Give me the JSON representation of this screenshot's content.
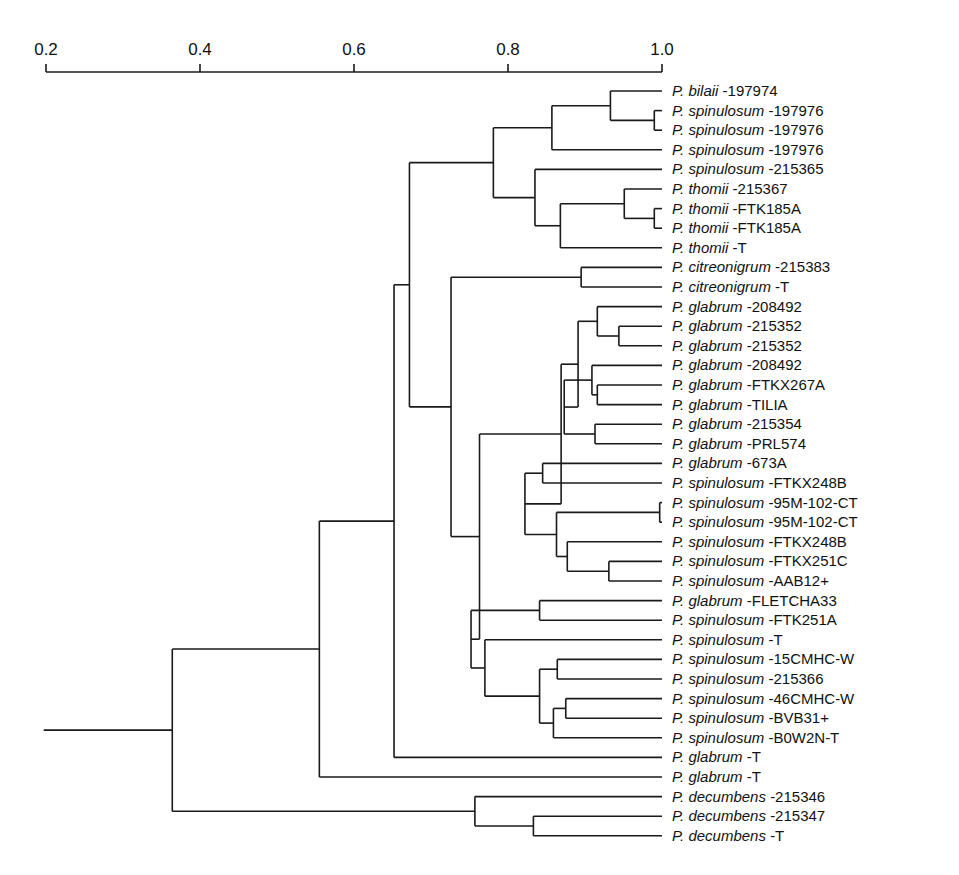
{
  "chart_data": {
    "type": "dendrogram",
    "title": "",
    "xlabel": "",
    "axis": {
      "position": "top",
      "min": 0.2,
      "max": 1.0,
      "ticks": [
        0.2,
        0.4,
        0.6,
        0.8,
        1.0
      ],
      "tick_labels": [
        "0.2",
        "0.4",
        "0.6",
        "0.8",
        "1.0"
      ]
    },
    "leaves": [
      {
        "genus": "P.",
        "species": "bilaii",
        "strain": "-197974"
      },
      {
        "genus": "P.",
        "species": "spinulosum",
        "strain": "-197976"
      },
      {
        "genus": "P.",
        "species": "spinulosum",
        "strain": "-197976"
      },
      {
        "genus": "P.",
        "species": "spinulosum",
        "strain": "-197976"
      },
      {
        "genus": "P.",
        "species": "spinulosum",
        "strain": "-215365"
      },
      {
        "genus": "P.",
        "species": "thomii",
        "strain": "-215367"
      },
      {
        "genus": "P.",
        "species": "thomii",
        "strain": "-FTK185A"
      },
      {
        "genus": "P.",
        "species": "thomii",
        "strain": "-FTK185A"
      },
      {
        "genus": "P.",
        "species": "thomii",
        "strain": "-T"
      },
      {
        "genus": "P.",
        "species": "citreonigrum",
        "strain": "-215383"
      },
      {
        "genus": "P.",
        "species": "citreonigrum",
        "strain": "-T"
      },
      {
        "genus": "P.",
        "species": "glabrum",
        "strain": "-208492"
      },
      {
        "genus": "P.",
        "species": "glabrum",
        "strain": "-215352"
      },
      {
        "genus": "P.",
        "species": "glabrum",
        "strain": "-215352"
      },
      {
        "genus": "P.",
        "species": "glabrum",
        "strain": "-208492"
      },
      {
        "genus": "P.",
        "species": "glabrum",
        "strain": "-FTKX267A"
      },
      {
        "genus": "P.",
        "species": "glabrum",
        "strain": "-TILIA"
      },
      {
        "genus": "P.",
        "species": "glabrum",
        "strain": "-215354"
      },
      {
        "genus": "P.",
        "species": "glabrum",
        "strain": "-PRL574"
      },
      {
        "genus": "P.",
        "species": "glabrum",
        "strain": "-673A"
      },
      {
        "genus": "P.",
        "species": "spinulosum",
        "strain": "-FTKX248B"
      },
      {
        "genus": "P.",
        "species": "spinulosum",
        "strain": "-95M-102-CT"
      },
      {
        "genus": "P.",
        "species": "spinulosum",
        "strain": "-95M-102-CT"
      },
      {
        "genus": "P.",
        "species": "spinulosum",
        "strain": "-FTKX248B"
      },
      {
        "genus": "P.",
        "species": "spinulosum",
        "strain": "-FTKX251C"
      },
      {
        "genus": "P.",
        "species": "spinulosum",
        "strain": "-AAB12+"
      },
      {
        "genus": "P.",
        "species": "glabrum",
        "strain": "-FLETCHA33"
      },
      {
        "genus": "P.",
        "species": "spinulosum",
        "strain": "-FTK251A"
      },
      {
        "genus": "P.",
        "species": "spinulosum",
        "strain": "-T"
      },
      {
        "genus": "P.",
        "species": "spinulosum",
        "strain": "-15CMHC-W"
      },
      {
        "genus": "P.",
        "species": "spinulosum",
        "strain": "-215366"
      },
      {
        "genus": "P.",
        "species": "spinulosum",
        "strain": "-46CMHC-W"
      },
      {
        "genus": "P.",
        "species": "spinulosum",
        "strain": "-BVB31+"
      },
      {
        "genus": "P.",
        "species": "spinulosum",
        "strain": "-B0W2N-T"
      },
      {
        "genus": "P.",
        "species": "glabrum",
        "strain": "-T"
      },
      {
        "genus": "P.",
        "species": "glabrum",
        "strain": "-T"
      },
      {
        "genus": "P.",
        "species": "decumbens",
        "strain": "-215346"
      },
      {
        "genus": "P.",
        "species": "decumbens",
        "strain": "-215347"
      },
      {
        "genus": "P.",
        "species": "decumbens",
        "strain": "-T"
      }
    ],
    "tree": {
      "s": 0.364,
      "c": [
        {
          "s": 0.555,
          "c": [
            {
              "s": 0.652,
              "c": [
                {
                  "s": 0.672,
                  "c": [
                    {
                      "s": 0.781,
                      "c": [
                        {
                          "s": 0.857,
                          "c": [
                            {
                              "s": 0.933,
                              "c": [
                                {
                                  "l": 0
                                },
                                {
                                  "s": 0.99,
                                  "c": [
                                    {
                                      "l": 1
                                    },
                                    {
                                      "l": 2
                                    }
                                  ]
                                }
                              ]
                            },
                            {
                              "l": 3
                            }
                          ]
                        },
                        {
                          "s": 0.835,
                          "c": [
                            {
                              "l": 4
                            },
                            {
                              "s": 0.868,
                              "c": [
                                {
                                  "s": 0.951,
                                  "c": [
                                    {
                                      "l": 5
                                    },
                                    {
                                      "s": 0.99,
                                      "c": [
                                        {
                                          "l": 6
                                        },
                                        {
                                          "l": 7
                                        }
                                      ]
                                    }
                                  ]
                                },
                                {
                                  "l": 8
                                }
                              ]
                            }
                          ]
                        }
                      ]
                    },
                    {
                      "s": 0.726,
                      "c": [
                        {
                          "s": 0.895,
                          "c": [
                            {
                              "l": 9
                            },
                            {
                              "l": 10
                            }
                          ]
                        },
                        {
                          "s": 0.763,
                          "c": [
                            {
                              "s": 0.869,
                              "c": [
                                {
                                  "s": 0.891,
                                  "c": [
                                    {
                                      "s": 0.916,
                                      "c": [
                                        {
                                          "l": 11
                                        },
                                        {
                                          "s": 0.944,
                                          "c": [
                                            {
                                              "l": 12
                                            },
                                            {
                                              "l": 13
                                            }
                                          ]
                                        }
                                      ]
                                    },
                                    {
                                      "s": 0.873,
                                      "c": [
                                        {
                                          "s": 0.909,
                                          "c": [
                                            {
                                              "l": 14
                                            },
                                            {
                                              "s": 0.916,
                                              "c": [
                                                {
                                                  "l": 15
                                                },
                                                {
                                                  "l": 16
                                                }
                                              ]
                                            }
                                          ]
                                        },
                                        {
                                          "s": 0.913,
                                          "c": [
                                            {
                                              "l": 17
                                            },
                                            {
                                              "l": 18
                                            }
                                          ]
                                        }
                                      ]
                                    }
                                  ]
                                },
                                {
                                  "s": 0.822,
                                  "c": [
                                    {
                                      "s": 0.845,
                                      "c": [
                                        {
                                          "l": 19
                                        },
                                        {
                                          "l": 20
                                        }
                                      ]
                                    },
                                    {
                                      "s": 0.863,
                                      "c": [
                                        {
                                          "s": 0.997,
                                          "c": [
                                            {
                                              "l": 21
                                            },
                                            {
                                              "l": 22
                                            }
                                          ]
                                        },
                                        {
                                          "s": 0.877,
                                          "c": [
                                            {
                                              "l": 23
                                            },
                                            {
                                              "s": 0.931,
                                              "c": [
                                                {
                                                  "l": 24
                                                },
                                                {
                                                  "l": 25
                                                }
                                              ]
                                            }
                                          ]
                                        }
                                      ]
                                    }
                                  ]
                                }
                              ]
                            },
                            {
                              "s": 0.752,
                              "c": [
                                {
                                  "s": 0.841,
                                  "c": [
                                    {
                                      "l": 26
                                    },
                                    {
                                      "l": 27
                                    }
                                  ]
                                },
                                {
                                  "s": 0.77,
                                  "c": [
                                    {
                                      "l": 28
                                    },
                                    {
                                      "s": 0.841,
                                      "c": [
                                        {
                                          "s": 0.864,
                                          "c": [
                                            {
                                              "l": 29
                                            },
                                            {
                                              "l": 30
                                            }
                                          ]
                                        },
                                        {
                                          "s": 0.859,
                                          "c": [
                                            {
                                              "s": 0.875,
                                              "c": [
                                                {
                                                  "l": 31
                                                },
                                                {
                                                  "l": 32
                                                }
                                              ]
                                            },
                                            {
                                              "l": 33
                                            }
                                          ]
                                        }
                                      ]
                                    }
                                  ]
                                }
                              ]
                            }
                          ]
                        }
                      ]
                    }
                  ]
                },
                {
                  "l": 34
                }
              ]
            },
            {
              "l": 35
            }
          ]
        },
        {
          "s": 0.757,
          "c": [
            {
              "l": 36
            },
            {
              "s": 0.833,
              "c": [
                {
                  "l": 37
                },
                {
                  "l": 38
                }
              ]
            }
          ]
        }
      ]
    },
    "root_stub_start": 0.197
  }
}
